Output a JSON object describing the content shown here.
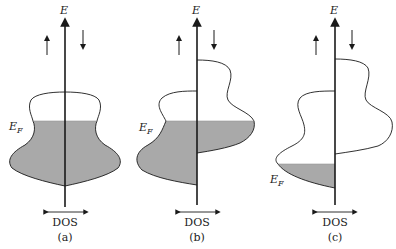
{
  "figure": {
    "panels": [
      {
        "id": "a",
        "caption": "(a)",
        "axis_label": "E",
        "fermi_label": "E",
        "fermi_sub": "F",
        "dos_label": "DOS",
        "description": "Non-magnetic: equal spin-up and spin-down DOS, filled to E_F"
      },
      {
        "id": "b",
        "caption": "(b)",
        "axis_label": "E",
        "fermi_label": "E",
        "fermi_sub": "F",
        "dos_label": "DOS",
        "description": "Ferromagnet: spin-down band shifted up, partially filled"
      },
      {
        "id": "c",
        "caption": "(c)",
        "axis_label": "E",
        "fermi_label": "E",
        "fermi_sub": "F",
        "dos_label": "DOS",
        "description": "Half-metal / shifted bands: only spin-up band filled below E_F"
      }
    ],
    "spin_up_icon": "arrow-up",
    "spin_down_icon": "arrow-down",
    "colors": {
      "fill": "#a9a9a9",
      "line": "#1a1a1a",
      "background": "#ffffff"
    }
  }
}
